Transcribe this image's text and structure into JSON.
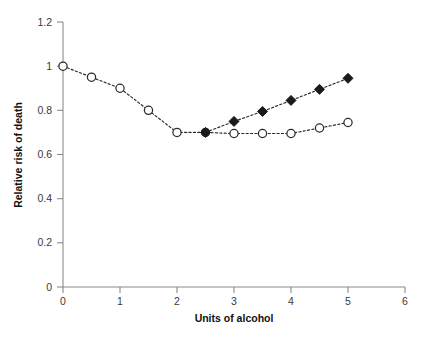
{
  "chart_data": {
    "type": "line",
    "title": "",
    "xlabel": "Units of alcohol",
    "ylabel": "Relative risk of death",
    "xlim": [
      0,
      6
    ],
    "ylim": [
      0,
      1.2
    ],
    "grid": false,
    "legend": "none",
    "xticks": [
      "0",
      "1",
      "2",
      "3",
      "4",
      "5",
      "6"
    ],
    "xtick_values": [
      0,
      1,
      2,
      3,
      4,
      5,
      6
    ],
    "yticks": [
      "0",
      "0.2",
      "0.4",
      "0.6",
      "0.8",
      "1",
      "1.2"
    ],
    "ytick_values": [
      0,
      0.2,
      0.4,
      0.6,
      0.8,
      1,
      1.2
    ],
    "series": [
      {
        "name": "open-circle-series",
        "marker": "open-circle",
        "linestyle": "dashed",
        "color": "#2b2b2b",
        "x": [
          0,
          0.5,
          1,
          1.5,
          2,
          2.5,
          3,
          3.5,
          4,
          4.5,
          5
        ],
        "values": [
          1.0,
          0.95,
          0.9,
          0.8,
          0.7,
          0.7,
          0.695,
          0.695,
          0.695,
          0.72,
          0.745
        ]
      },
      {
        "name": "filled-diamond-series",
        "marker": "filled-diamond",
        "linestyle": "dotted",
        "color": "#1a1a1a",
        "x": [
          2.5,
          3,
          3.5,
          4,
          4.5,
          5
        ],
        "values": [
          0.7,
          0.75,
          0.795,
          0.845,
          0.895,
          0.945
        ]
      }
    ]
  },
  "axes": {
    "x_title": "Units of alcohol",
    "y_title": "Relative risk of death"
  }
}
